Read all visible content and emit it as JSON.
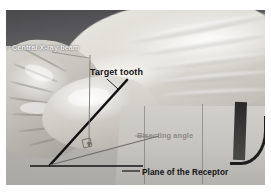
{
  "figure": {
    "labels": {
      "central_beam": "Central X-ray beam",
      "target_tooth": "Target tooth",
      "bisecting_angle": "Bisecting angle",
      "plane_of_receptor": "Plane of the Receptor"
    },
    "colors": {
      "beam_label_text": "#f2f1ee",
      "target_label_text": "#121212",
      "bisect_label_text": "#8c8a84",
      "plane_label_text": "#121212",
      "tooth_axis_line": "#111111",
      "beam_line": "#7a7872",
      "bisector_line": "#6e6c66",
      "receptor_line": "#111111",
      "page_background": "#ffffff",
      "photo_background": "#b9b9b6"
    },
    "geometry": {
      "vertex": {
        "x": 44,
        "y": 155
      },
      "tooth_axis_end": {
        "x": 121,
        "y": 70
      },
      "beam_top": {
        "x": 84,
        "y": 45
      },
      "beam_arrow_tip": {
        "x": 83,
        "y": 139
      },
      "bisector_end": {
        "x": 153,
        "y": 126
      },
      "receptor_line_start": {
        "x": 24,
        "y": 156
      },
      "receptor_line_end": {
        "x": 137,
        "y": 156
      },
      "right_angle_marker": {
        "x": 77,
        "y": 133,
        "size": 8
      }
    }
  }
}
